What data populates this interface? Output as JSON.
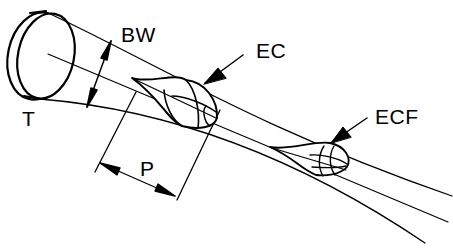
{
  "diagram": {
    "type": "technical-line-drawing",
    "colors": {
      "ink": "#000000",
      "background": "#ffffff"
    },
    "labels": {
      "transducer": "T",
      "beam_width": "BW",
      "echo_chamber": "EC",
      "echo_chamber_far": "ECF",
      "pulse_length": "P"
    }
  }
}
